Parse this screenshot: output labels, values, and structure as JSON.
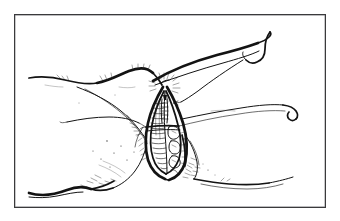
{
  "document": {
    "type": "illustration",
    "title": "Anatomical line drawing",
    "medium": "pen-and-ink line art",
    "subject": "female external genitalia (vulva) anatomical illustration",
    "background_color": "#ffffff",
    "ink_color": "#131313",
    "page_margin_color": "#ffffff"
  },
  "frame": {
    "name": "figure-border",
    "style": "thin rectangular rule",
    "stroke_color": "#3a3a3c",
    "inner_fill": "#ffffff",
    "x": 14,
    "y": 14,
    "width": 312,
    "height": 194
  },
  "drawing": {
    "viewbox": "0 0 312 194",
    "regions": [
      {
        "name": "upper-left-thigh-contour",
        "description": "long sweeping contour across upper left"
      },
      {
        "name": "upper-right-thigh-contour",
        "description": "sweeping contour rising to upper right with terminal hook"
      },
      {
        "name": "right-fold-curve",
        "description": "horizontal fold curve on the right with hooked end"
      },
      {
        "name": "left-fold-curve",
        "description": "short fold curve on the mid-left"
      },
      {
        "name": "central-vulva-structure",
        "description": "vertical leaf-shaped labial opening with internal hatching"
      },
      {
        "name": "labia-majora-left",
        "description": "left outer fold with shading"
      },
      {
        "name": "labia-majora-right",
        "description": "right outer fold with fine hatching"
      },
      {
        "name": "perineum-contour",
        "description": "contour sweeping to lower left and lower right"
      },
      {
        "name": "pubic-hair-strokes",
        "description": "short radiating hair-like strokes at the convergence point"
      },
      {
        "name": "stipple-shading",
        "description": "scattered stipple dots indicating skin texture"
      }
    ],
    "stroke_weights": {
      "hairline": 0.42,
      "thin": 0.62,
      "medium": 1.0,
      "bold": 1.75,
      "extra_bold": 2.7
    }
  }
}
